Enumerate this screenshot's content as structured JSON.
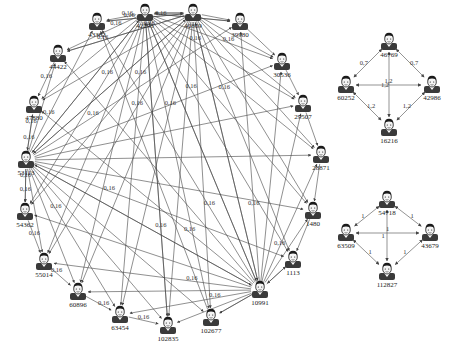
{
  "diagram": {
    "type": "directed-social-network",
    "node_icon": "person-avatar-icon",
    "colors": {
      "background": "#ffffff",
      "edge": "#444444",
      "label": "#222222",
      "avatar_dark": "#1a1a1a",
      "avatar_body": "#3a3a3a"
    }
  },
  "graphs": [
    {
      "id": "large-ring",
      "default_edge_weight": "0,16",
      "nodes": [
        {
          "id": "43382",
          "label": "43382",
          "x": 97,
          "y": 22
        },
        {
          "id": "42295",
          "label": "42295",
          "x": 145,
          "y": 13
        },
        {
          "id": "40869",
          "label": "40869",
          "x": 193,
          "y": 13
        },
        {
          "id": "39980",
          "label": "39980",
          "x": 240,
          "y": 22
        },
        {
          "id": "44422",
          "label": "44422",
          "x": 58,
          "y": 54
        },
        {
          "id": "30536",
          "label": "30536",
          "x": 282,
          "y": 62
        },
        {
          "id": "47880",
          "label": "47880",
          "x": 34,
          "y": 105
        },
        {
          "id": "29507",
          "label": "29507",
          "x": 303,
          "y": 104
        },
        {
          "id": "53113",
          "label": "53113",
          "x": 26,
          "y": 160
        },
        {
          "id": "28871",
          "label": "28871",
          "x": 321,
          "y": 155
        },
        {
          "id": "54362",
          "label": "54362",
          "x": 25,
          "y": 212
        },
        {
          "id": "1480",
          "label": "1480",
          "x": 313,
          "y": 211
        },
        {
          "id": "55014",
          "label": "55014",
          "x": 44,
          "y": 262
        },
        {
          "id": "1113",
          "label": "1113",
          "x": 293,
          "y": 260
        },
        {
          "id": "60896",
          "label": "60896",
          "x": 78,
          "y": 292
        },
        {
          "id": "10991",
          "label": "10991",
          "x": 260,
          "y": 290
        },
        {
          "id": "63454",
          "label": "63454",
          "x": 120,
          "y": 315
        },
        {
          "id": "102677",
          "label": "102677",
          "x": 211,
          "y": 318
        },
        {
          "id": "102835",
          "label": "102835",
          "x": 168,
          "y": 326
        }
      ],
      "visible_edge_labels": [
        "0,16",
        "1"
      ]
    },
    {
      "id": "small-diamond-1",
      "nodes": [
        {
          "id": "46769",
          "label": "46769",
          "x": 389,
          "y": 42
        },
        {
          "id": "60252",
          "label": "60252",
          "x": 346,
          "y": 85
        },
        {
          "id": "42986",
          "label": "42986",
          "x": 432,
          "y": 85
        },
        {
          "id": "16216",
          "label": "16216",
          "x": 389,
          "y": 128
        }
      ],
      "edges": [
        {
          "from": "46769",
          "to": "60252",
          "label": "0,7"
        },
        {
          "from": "46769",
          "to": "42986",
          "label": "0,7"
        },
        {
          "from": "60252",
          "to": "16216",
          "label": "1,2"
        },
        {
          "from": "42986",
          "to": "16216",
          "label": "1,2"
        },
        {
          "from": "60252",
          "to": "42986",
          "label": "1,2"
        },
        {
          "from": "46769",
          "to": "16216",
          "label": "1,2"
        }
      ]
    },
    {
      "id": "small-diamond-2",
      "nodes": [
        {
          "id": "54718",
          "label": "54718",
          "x": 387,
          "y": 200
        },
        {
          "id": "63509",
          "label": "63509",
          "x": 346,
          "y": 233
        },
        {
          "id": "43679",
          "label": "43679",
          "x": 430,
          "y": 233
        },
        {
          "id": "112827",
          "label": "112827",
          "x": 387,
          "y": 272
        }
      ],
      "edges": [
        {
          "from": "54718",
          "to": "63509",
          "label": "1"
        },
        {
          "from": "54718",
          "to": "43679",
          "label": "1"
        },
        {
          "from": "63509",
          "to": "112827",
          "label": "1"
        },
        {
          "from": "43679",
          "to": "112827",
          "label": "1"
        },
        {
          "from": "63509",
          "to": "43679",
          "label": "1"
        },
        {
          "from": "54718",
          "to": "112827",
          "label": "1"
        }
      ]
    }
  ]
}
